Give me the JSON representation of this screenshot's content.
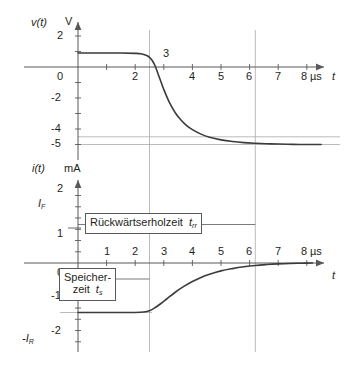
{
  "figure": {
    "background": "#ffffff",
    "curve_color": "#3b3b3d",
    "axis_color": "#58595b",
    "guide_color": "#a7a9ac"
  },
  "upper_plot": {
    "y_axis_label": "v(t)",
    "y_axis_unit": "V",
    "x_axis_label": "t",
    "x_axis_unit": "µs",
    "y_ticks": [
      "2",
      "0",
      "-2",
      "-4",
      "-5"
    ],
    "x_ticks": [
      "0",
      "2",
      "3",
      "4",
      "5",
      "6",
      "7",
      "8"
    ],
    "tick_above_axis": "3"
  },
  "lower_plot": {
    "y_axis_label": "i(t)",
    "y_axis_unit": "mA",
    "x_axis_label": "t",
    "x_axis_unit": "µs",
    "y_ticks": [
      "2",
      "1",
      "0",
      "-1",
      "-2"
    ],
    "y_named_ticks": {
      "forward": "I",
      "forward_sub": "F",
      "reverse": "-I",
      "reverse_sub": "R"
    },
    "x_ticks": [
      "1",
      "2",
      "3",
      "4",
      "5",
      "6",
      "7",
      "8"
    ]
  },
  "annotations": {
    "recovery": {
      "text": "Rückwärtserholzeit",
      "symbol": "t",
      "symbol_sub": "rr"
    },
    "storage": {
      "line1": "Speicher-",
      "line2": "zeit",
      "symbol": "t",
      "symbol_sub": "s"
    }
  },
  "chart_data": {
    "type": "line",
    "title": "",
    "panels": [
      {
        "name": "voltage",
        "ylabel": "v(t)",
        "yunit": "V",
        "xlabel": "t",
        "xunit": "µs",
        "xlim": [
          0,
          8.6
        ],
        "ylim": [
          -5.6,
          2.6
        ],
        "yticks": [
          2,
          0,
          -2,
          -4,
          -5
        ],
        "xticks": [
          0,
          1,
          2,
          3,
          4,
          5,
          6,
          7,
          8
        ],
        "xticklabels": [
          "0",
          "",
          "2",
          "3",
          "4",
          "5",
          "6",
          "7",
          "8"
        ],
        "grid": false,
        "series": [
          {
            "name": "v(t)",
            "x": [
              0.0,
              0.5,
              1.0,
              1.5,
              2.0,
              2.2,
              2.4,
              2.5,
              2.6,
              2.7,
              2.8,
              2.9,
              3.0,
              3.2,
              3.4,
              3.6,
              3.8,
              4.0,
              4.3,
              4.6,
              5.0,
              5.4,
              5.8,
              6.2,
              6.6,
              7.0,
              7.5,
              8.0,
              8.5
            ],
            "y": [
              0.9,
              0.9,
              0.9,
              0.9,
              0.88,
              0.85,
              0.74,
              0.62,
              0.4,
              0.05,
              -0.45,
              -0.95,
              -1.45,
              -2.3,
              -2.95,
              -3.42,
              -3.78,
              -4.04,
              -4.33,
              -4.53,
              -4.7,
              -4.81,
              -4.88,
              -4.92,
              -4.95,
              -4.97,
              -4.99,
              -5.0,
              -5.0
            ]
          }
        ],
        "reference_lines": {
          "horizontal": [
            -4.5,
            -5.0
          ],
          "vertical": [
            2.5,
            6.2
          ]
        }
      },
      {
        "name": "current",
        "ylabel": "i(t)",
        "yunit": "mA",
        "xlabel": "t",
        "xunit": "µs",
        "xlim": [
          0,
          8.6
        ],
        "ylim": [
          -2.6,
          2.4
        ],
        "yticks": [
          2,
          1,
          0,
          -1,
          -2
        ],
        "xticks": [
          0,
          1,
          2,
          3,
          4,
          5,
          6,
          7,
          8
        ],
        "xticklabels": [
          "0",
          "1",
          "2",
          "3",
          "4",
          "5",
          "6",
          "7",
          "8"
        ],
        "grid": false,
        "named_levels": {
          "I_F": 1.55,
          "minus_I_R": -2.2
        },
        "series": [
          {
            "name": "i(t)",
            "x": [
              0.0,
              0.5,
              1.0,
              1.5,
              2.0,
              2.3,
              2.5,
              2.7,
              2.9,
              3.1,
              3.4,
              3.7,
              4.0,
              4.3,
              4.6,
              5.0,
              5.4,
              5.8,
              6.2,
              6.6,
              7.0,
              7.4,
              7.8,
              8.2
            ],
            "y": [
              -2.2,
              -2.2,
              -2.2,
              -2.2,
              -2.2,
              -2.18,
              -2.12,
              -1.98,
              -1.8,
              -1.6,
              -1.3,
              -1.04,
              -0.82,
              -0.64,
              -0.5,
              -0.35,
              -0.25,
              -0.17,
              -0.11,
              -0.07,
              -0.04,
              -0.02,
              -0.01,
              0.0
            ]
          }
        ],
        "reference_lines": {
          "vertical": [
            2.5,
            6.2
          ]
        }
      }
    ],
    "annotations": [
      {
        "text": "Rückwärtserholzeit t_rr",
        "from_x": 0,
        "to_x": 6.2,
        "panel": "current",
        "y": 1.22
      },
      {
        "text": "Speicherzeit t_s",
        "from_x": 0,
        "to_x": 2.5,
        "panel": "current",
        "y": -0.72
      }
    ]
  }
}
